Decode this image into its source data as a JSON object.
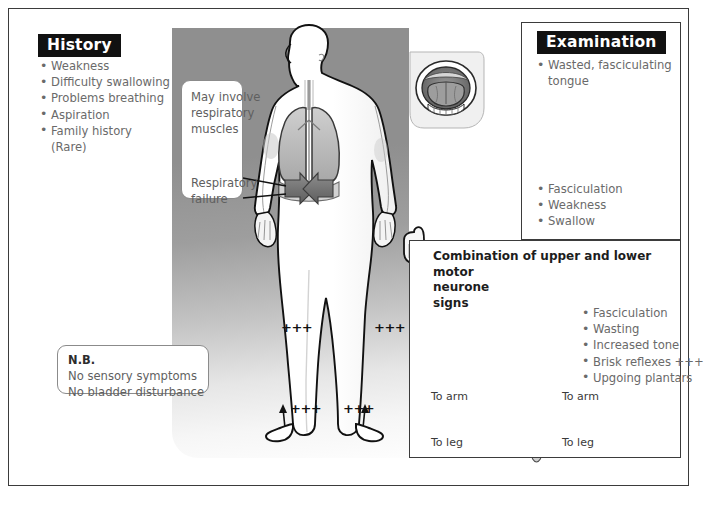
{
  "history": {
    "heading": "History",
    "items": [
      "Weakness",
      "Difficulty swallowing",
      "Problems breathing",
      "Aspiration",
      "Family history",
      "(Rare)"
    ]
  },
  "examination": {
    "heading": "Examination",
    "top_items": [
      "Wasted, fasciculating",
      "tongue"
    ],
    "bottom_items": [
      "Fasciculation",
      "Weakness",
      "Swallow"
    ]
  },
  "respiratory_callout": {
    "line1": "May involve",
    "line2": "respiratory",
    "line3": "muscles",
    "arrow": "down-arrow",
    "line4": "Respiratory",
    "line5": "failure"
  },
  "nb_box": {
    "title": "N.B.",
    "line1": "No sensory symptoms",
    "line2": "No bladder disturbance"
  },
  "motor_panel": {
    "title_line1": "Combination of upper and lower motor",
    "title_line2": "neurone",
    "title_line3": "signs",
    "items": [
      "Fasciculation",
      "Wasting",
      "Increased tone",
      "Brisk reflexes +++",
      "Upgoing plantars"
    ],
    "cord_labels": {
      "arm_left": "To arm",
      "arm_right": "To arm",
      "leg_left": "To leg",
      "leg_right": "To leg"
    }
  },
  "body_figure": {
    "reflex_marks": [
      "+++",
      "+++",
      "+++",
      "+++"
    ],
    "inset": "open-mouth-tongue-inset"
  },
  "colors": {
    "frame": "#3b3b3b",
    "heading_bg": "#111111",
    "heading_text": "#ffffff",
    "body_text": "#6a6a6a",
    "panel_title": "#1d1d1d",
    "grey_panel_top": "#8f8f8f",
    "grey_panel_bottom": "#fdfdfd",
    "anatomy_fill": "#b9b9b9",
    "anatomy_line": "#1a1a1a"
  }
}
